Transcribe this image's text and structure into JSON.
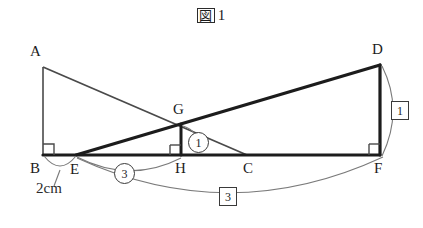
{
  "figure": {
    "title_kanji": "図",
    "title_number": "1",
    "title_full": "図 1"
  },
  "vertices": [
    {
      "name": "A",
      "label": "A",
      "x": 43,
      "y": 67,
      "label_x": 30,
      "label_y": 44
    },
    {
      "name": "B",
      "label": "B",
      "x": 43,
      "y": 155,
      "label_x": 30,
      "label_y": 161
    },
    {
      "name": "C",
      "label": "C",
      "x": 247,
      "y": 155,
      "label_x": 243,
      "label_y": 161
    },
    {
      "name": "D",
      "label": "D",
      "x": 380,
      "y": 65,
      "label_x": 372,
      "label_y": 42
    },
    {
      "name": "E",
      "label": "E",
      "x": 76,
      "y": 155,
      "label_x": 70,
      "label_y": 162
    },
    {
      "name": "F",
      "label": "F",
      "x": 380,
      "y": 155,
      "label_x": 374,
      "label_y": 161
    },
    {
      "name": "G",
      "label": "G",
      "x": 181,
      "y": 124,
      "label_x": 173,
      "label_y": 102
    },
    {
      "name": "H",
      "label": "H",
      "x": 181,
      "y": 155,
      "label_x": 175,
      "label_y": 161
    }
  ],
  "segments": [
    {
      "name": "segment-AB",
      "from": "A",
      "to": "B",
      "weight": "thin"
    },
    {
      "name": "segment-AC",
      "from": "A",
      "to": "C",
      "weight": "thin"
    },
    {
      "name": "segment-ED",
      "from": "E",
      "to": "D",
      "weight": "thick"
    },
    {
      "name": "segment-DF",
      "from": "D",
      "to": "F",
      "weight": "thick"
    },
    {
      "name": "segment-BF",
      "from": "B",
      "to": "F",
      "weight": "thick"
    },
    {
      "name": "segment-GH",
      "from": "G",
      "to": "H",
      "weight": "thick"
    }
  ],
  "right_angles": [
    {
      "name": "right-angle-B",
      "at": "B"
    },
    {
      "name": "right-angle-H",
      "at": "H"
    },
    {
      "name": "right-angle-F",
      "at": "F"
    }
  ],
  "measures": [
    {
      "name": "measure-BE",
      "text": "2cm",
      "style": "plain",
      "spans": "B-E",
      "label_x": 36,
      "label_y": 181
    },
    {
      "name": "measure-EH-ratio",
      "text": "3",
      "style": "circle",
      "spans": "E-H",
      "label_x": 114,
      "label_y": 163
    },
    {
      "name": "measure-GH-ratio",
      "text": "1",
      "style": "circle",
      "spans": "G-angle",
      "label_x": 188,
      "label_y": 132
    },
    {
      "name": "measure-DF-ratio",
      "text": "1",
      "style": "box",
      "spans": "D-F",
      "label_x": 391,
      "label_y": 101
    },
    {
      "name": "measure-EF-ratio",
      "text": "3",
      "style": "box",
      "spans": "E-F",
      "label_x": 219,
      "label_y": 187
    }
  ]
}
